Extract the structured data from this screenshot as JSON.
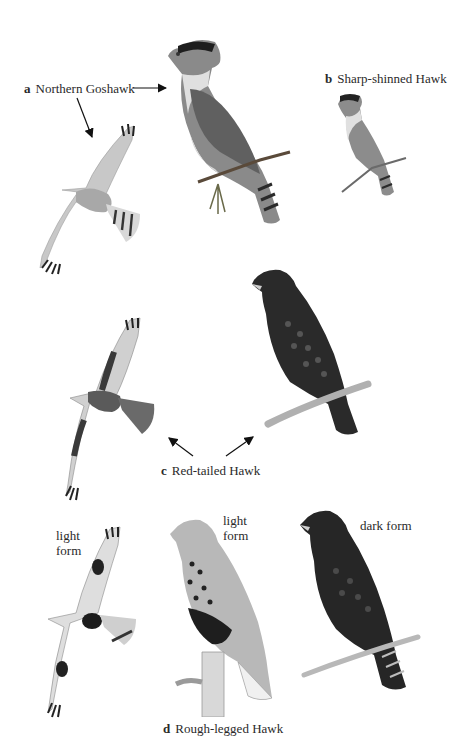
{
  "plate": {
    "background": "#ffffff",
    "ink_color": "#222222"
  },
  "species": [
    {
      "letter": "a",
      "name": "Northern Goshawk",
      "figures": [
        {
          "pose": "perched",
          "description": "adult perched on conifer twig, pale eyebrow, banded tail"
        },
        {
          "pose": "flight",
          "description": "underside in flight, barred wings and banded tail"
        }
      ]
    },
    {
      "letter": "b",
      "name": "Sharp-shinned Hawk",
      "figures": [
        {
          "pose": "perched",
          "description": "small perched hawk on twig, banded tail"
        }
      ]
    },
    {
      "letter": "c",
      "name": "Red-tailed Hawk",
      "figures": [
        {
          "pose": "flight",
          "description": "underside in flight, dark patagial bar"
        },
        {
          "pose": "perched",
          "description": "dark perched bird on branch"
        }
      ]
    },
    {
      "letter": "d",
      "name": "Rough-legged Hawk",
      "figures": [
        {
          "pose": "flight",
          "form": "light form",
          "description": "underside in flight, dark carpal patches and belly band"
        },
        {
          "pose": "perched",
          "form": "light form",
          "description": "perched on stump, streaked breast, dark belly"
        },
        {
          "pose": "perched",
          "form": "dark form",
          "description": "dark bird perched on branch, banded tail"
        }
      ]
    }
  ],
  "form_labels": {
    "d_flight_line1": "light",
    "d_flight_line2": "form",
    "d_perched_line1": "light",
    "d_perched_line2": "form",
    "d_dark": "dark form"
  },
  "arrows": [
    {
      "from": "label-a",
      "to": "goshawk-perched",
      "direction": "right"
    },
    {
      "from": "label-a",
      "to": "goshawk-flight",
      "direction": "down"
    },
    {
      "from": "label-c",
      "to": "redtail-flight",
      "direction": "up-left"
    },
    {
      "from": "label-c",
      "to": "redtail-perched",
      "direction": "up-right"
    }
  ]
}
